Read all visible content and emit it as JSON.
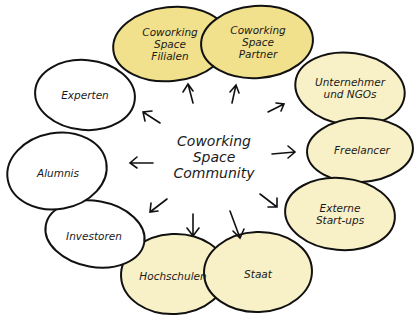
{
  "diagram": {
    "title": "Coworking Space Community",
    "center": {
      "lines": [
        "Coworking",
        "Space",
        "Community"
      ]
    },
    "colors": {
      "stroke": "#111111",
      "yellow_strong": "#f1e08c",
      "yellow_pale": "#f8f0c6",
      "white": "#ffffff"
    },
    "nodes": [
      {
        "id": "filialen",
        "lines": [
          "Coworking",
          "Space",
          "Filialen"
        ],
        "fill": "yellow_strong"
      },
      {
        "id": "partner",
        "lines": [
          "Coworking",
          "Space",
          "Partner"
        ],
        "fill": "yellow_strong"
      },
      {
        "id": "unternehmer",
        "lines": [
          "Unternehmer",
          "und NGOs"
        ],
        "fill": "yellow_pale"
      },
      {
        "id": "freelancer",
        "lines": [
          "Freelancer"
        ],
        "fill": "yellow_pale"
      },
      {
        "id": "startups",
        "lines": [
          "Externe",
          "Start-ups"
        ],
        "fill": "yellow_pale"
      },
      {
        "id": "staat",
        "lines": [
          "Staat"
        ],
        "fill": "yellow_pale"
      },
      {
        "id": "hochschulen",
        "lines": [
          "Hochschulen"
        ],
        "fill": "yellow_pale"
      },
      {
        "id": "investoren",
        "lines": [
          "Investoren"
        ],
        "fill": "white"
      },
      {
        "id": "alumnis",
        "lines": [
          "Alumnis"
        ],
        "fill": "white"
      },
      {
        "id": "experten",
        "lines": [
          "Experten"
        ],
        "fill": "white"
      }
    ]
  }
}
